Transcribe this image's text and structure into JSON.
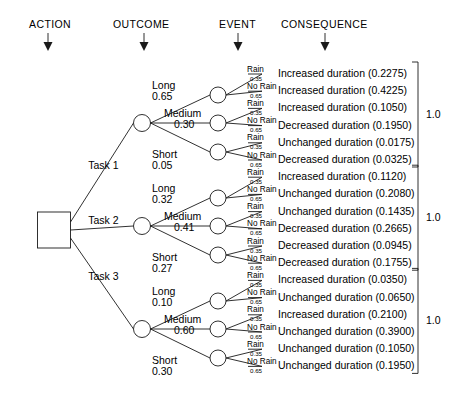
{
  "headers": [
    {
      "label": "ACTION",
      "x": 29,
      "ax": 48
    },
    {
      "label": "OUTCOME",
      "x": 113,
      "ax": 144
    },
    {
      "label": "EVENT",
      "x": 219,
      "ax": 238
    },
    {
      "label": "CONSEQUENCE",
      "x": 281,
      "ax": 325
    }
  ],
  "root": {
    "name": "decision-node"
  },
  "branch_total_label": "1.0",
  "event_labels": {
    "rain": "Rain",
    "no_rain": "No Rain"
  },
  "event_probs": {
    "rain": "0.35",
    "no_rain": "0.65"
  },
  "chart_data": {
    "type": "diagram",
    "columns": [
      "ACTION",
      "OUTCOME",
      "EVENT",
      "CONSEQUENCE"
    ],
    "event_probabilities": {
      "Rain": 0.35,
      "No Rain": 0.65
    },
    "group_totals": [
      1.0,
      1.0,
      1.0
    ],
    "branches": [
      {
        "action": "Task 1",
        "outcomes": [
          {
            "label": "Long",
            "prob": "0.65",
            "events": [
              {
                "event": "Rain",
                "prob": "0.35",
                "consequence": "Increased duration",
                "value": "0.2275"
              },
              {
                "event": "No Rain",
                "prob": "0.65",
                "consequence": "Increased duration",
                "value": "0.4225"
              }
            ]
          },
          {
            "label": "Medium",
            "prob": "0.30",
            "events": [
              {
                "event": "Rain",
                "prob": "0.35",
                "consequence": "Increased duration",
                "value": "0.1050"
              },
              {
                "event": "No Rain",
                "prob": "0.65",
                "consequence": "Decreased duration",
                "value": "0.1950"
              }
            ]
          },
          {
            "label": "Short",
            "prob": "0.05",
            "events": [
              {
                "event": "Rain",
                "prob": "0.35",
                "consequence": "Unchanged duration",
                "value": "0.0175"
              },
              {
                "event": "No Rain",
                "prob": "0.65",
                "consequence": "Decreased duration",
                "value": "0.0325"
              }
            ]
          }
        ]
      },
      {
        "action": "Task 2",
        "outcomes": [
          {
            "label": "Long",
            "prob": "0.32",
            "events": [
              {
                "event": "Rain",
                "prob": "0.35",
                "consequence": "Increased duration",
                "value": "0.1120"
              },
              {
                "event": "No Rain",
                "prob": "0.65",
                "consequence": "Unchanged duration",
                "value": "0.2080"
              }
            ]
          },
          {
            "label": "Medium",
            "prob": "0.41",
            "events": [
              {
                "event": "Rain",
                "prob": "0.35",
                "consequence": "Unchanged duration",
                "value": "0.1435"
              },
              {
                "event": "No Rain",
                "prob": "0.65",
                "consequence": "Decreased duration",
                "value": "0.2665"
              }
            ]
          },
          {
            "label": "Short",
            "prob": "0.27",
            "events": [
              {
                "event": "Rain",
                "prob": "0.35",
                "consequence": "Decreased duration",
                "value": "0.0945"
              },
              {
                "event": "No Rain",
                "prob": "0.65",
                "consequence": "Decreased duration",
                "value": "0.1755"
              }
            ]
          }
        ]
      },
      {
        "action": "Task 3",
        "outcomes": [
          {
            "label": "Long",
            "prob": "0.10",
            "events": [
              {
                "event": "Rain",
                "prob": "0.35",
                "consequence": "Increased duration",
                "value": "0.0350"
              },
              {
                "event": "No Rain",
                "prob": "0.65",
                "consequence": "Unchanged duration",
                "value": "0.0650"
              }
            ]
          },
          {
            "label": "Medium",
            "prob": "0.60",
            "events": [
              {
                "event": "Rain",
                "prob": "0.35",
                "consequence": "Increased duration",
                "value": "0.2100"
              },
              {
                "event": "No Rain",
                "prob": "0.65",
                "consequence": "Unchanged duration",
                "value": "0.3900"
              }
            ]
          },
          {
            "label": "Short",
            "prob": "0.30",
            "events": [
              {
                "event": "Rain",
                "prob": "0.35",
                "consequence": "Unchanged duration",
                "value": "0.1050"
              },
              {
                "event": "No Rain",
                "prob": "0.65",
                "consequence": "Unchanged duration",
                "value": "0.1950"
              }
            ]
          }
        ]
      }
    ]
  }
}
